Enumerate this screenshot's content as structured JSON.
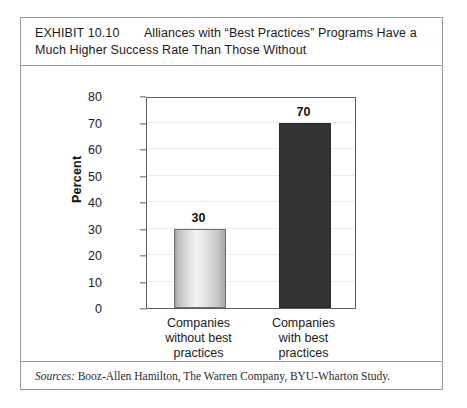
{
  "exhibit": {
    "title_line1_prefix": "EXHIBIT 10.10",
    "title_line1_rest": "Alliances with “Best Practices” Programs Have a",
    "title_line2": "Much Higher Success Rate Than Those Without",
    "sources_label": "Sources:",
    "sources_text": "Booz-Allen Hamilton, The Warren Company, BYU-Wharton Study."
  },
  "chart_data": {
    "type": "bar",
    "title": "EXHIBIT 10.10    Alliances with “Best Practices” Programs Have a Much Higher Success Rate Than Those Without",
    "categories": [
      "Companies without best practices",
      "Companies with best practices"
    ],
    "category_lines": [
      [
        "Companies",
        "without best",
        "practices"
      ],
      [
        "Companies",
        "with best",
        "practices"
      ]
    ],
    "values": [
      30,
      70
    ],
    "value_labels": [
      "30",
      "70"
    ],
    "xlabel": "",
    "ylabel": "Percent",
    "ylim": [
      0,
      80
    ],
    "ytick_step": 10,
    "yticks": [
      0,
      10,
      20,
      30,
      40,
      50,
      60,
      70,
      80
    ],
    "ytick_labels": [
      "0",
      "10",
      "20",
      "30",
      "40",
      "50",
      "60",
      "70",
      "80"
    ],
    "grid": true,
    "legend": false,
    "bar_colors": [
      "#dedede",
      "#333333"
    ]
  }
}
